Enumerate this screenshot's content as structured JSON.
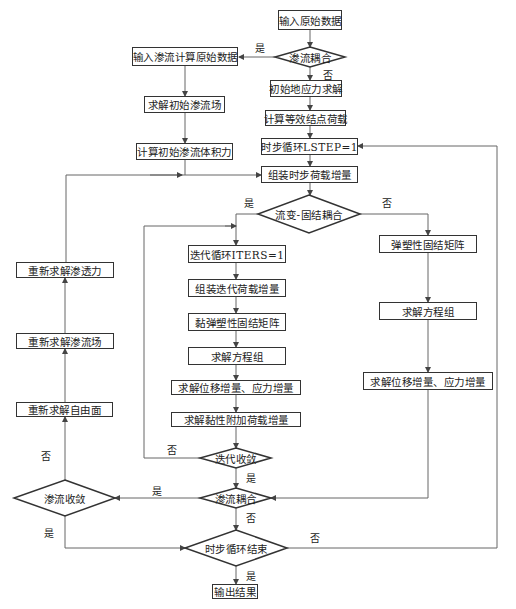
{
  "nodes": {
    "input_raw": "输入原始数据",
    "seepage_coupling_top": "渗流耦合",
    "input_seepage_raw": "输入渗流计算原始数据",
    "solve_init_seepage": "求解初始渗流场",
    "calc_init_seepage_body_force": "计算初始渗流体积力",
    "init_ground_stress": "初始地应力求解",
    "equiv_node_load": "计算等效结点荷载",
    "time_loop_start": "时步循环LSTEP=1",
    "assemble_time_load": "组装时步荷载增量",
    "rheo_consol_coupling": "流变-固结耦合",
    "iter_loop_start": "迭代循环ITERS=1",
    "assemble_iter_load": "组装迭代荷载增量",
    "visco_matrix": "黏弹塑性固结矩阵",
    "solve_eq_mid": "求解方程组",
    "solve_disp_stress_mid": "求解位移增量、应力增量",
    "solve_viscous_load": "求解黏性附加荷载增量",
    "iter_converge": "迭代收敛",
    "seepage_coupling_bottom": "渗流耦合",
    "time_loop_end": "时步循环结束",
    "output_result": "输出结果",
    "elastoplastic_matrix": "弹塑性固结矩阵",
    "solve_eq_right": "求解方程组",
    "solve_disp_stress_right": "求解位移增量、应力增量",
    "seepage_converge": "渗流收敛",
    "resolve_free_surface": "重新求解自由面",
    "resolve_seepage_field": "重新求解渗流场",
    "resolve_seepage_force": "重新求解渗透力"
  },
  "labels": {
    "yes": "是",
    "no": "否"
  },
  "colors": {
    "line": "#555555",
    "border": "#333333",
    "background": "#ffffff"
  }
}
